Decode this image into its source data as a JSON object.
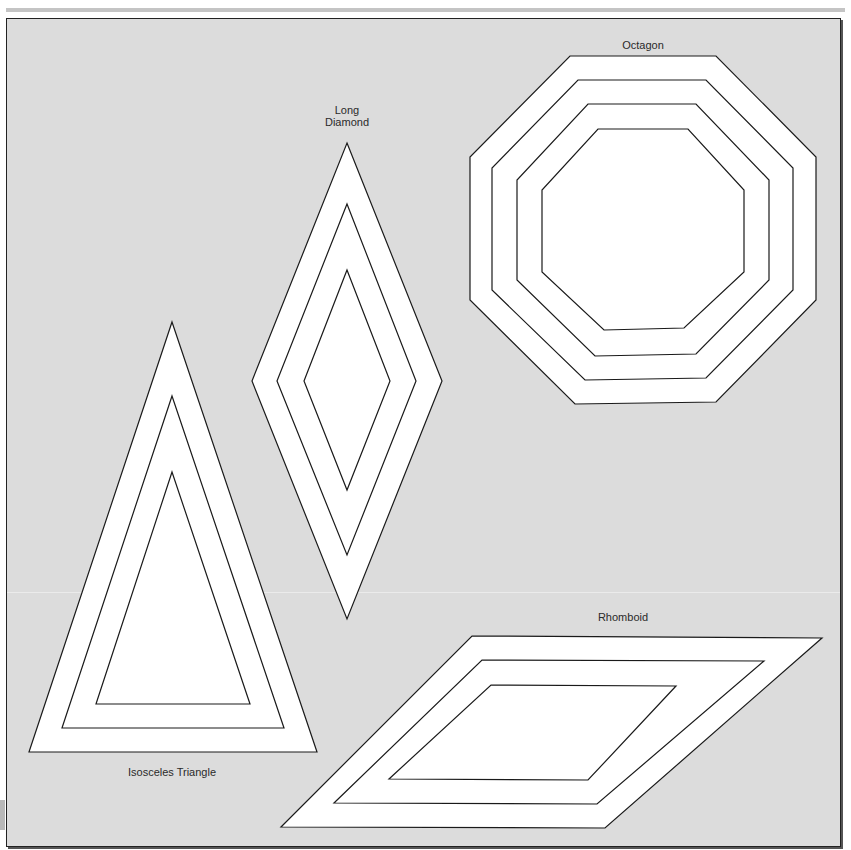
{
  "colors": {
    "background": "#dcdcdc",
    "shape_fill": "#ffffff",
    "stroke": "#1a1a1a",
    "frame_border": "#222222",
    "top_bar": "#c4c4c4"
  },
  "shapes": [
    {
      "id": "octagon",
      "label": "Octagon",
      "label_pos": [
        643,
        45
      ],
      "rings": [
        [
          [
            570,
            56
          ],
          [
            716,
            56
          ],
          [
            816,
            157
          ],
          [
            816,
            300
          ],
          [
            716,
            402
          ],
          [
            575,
            404
          ],
          [
            470,
            300
          ],
          [
            470,
            157
          ]
        ],
        [
          [
            578,
            80
          ],
          [
            706,
            80
          ],
          [
            793,
            168
          ],
          [
            793,
            290
          ],
          [
            706,
            378
          ],
          [
            585,
            380
          ],
          [
            492,
            290
          ],
          [
            492,
            168
          ]
        ],
        [
          [
            588,
            104
          ],
          [
            696,
            104
          ],
          [
            769,
            180
          ],
          [
            769,
            280
          ],
          [
            696,
            354
          ],
          [
            595,
            356
          ],
          [
            517,
            280
          ],
          [
            517,
            180
          ]
        ],
        [
          [
            598,
            129
          ],
          [
            688,
            129
          ],
          [
            744,
            190
          ],
          [
            744,
            272
          ],
          [
            684,
            328
          ],
          [
            604,
            330
          ],
          [
            542,
            272
          ],
          [
            542,
            190
          ]
        ]
      ]
    },
    {
      "id": "long-diamond",
      "label": "Long\nDiamond",
      "label_pos": [
        347,
        116
      ],
      "rings": [
        [
          [
            347,
            143
          ],
          [
            442,
            381
          ],
          [
            347,
            619
          ],
          [
            252,
            381
          ]
        ],
        [
          [
            347,
            204
          ],
          [
            416,
            381
          ],
          [
            347,
            555
          ],
          [
            277,
            381
          ]
        ],
        [
          [
            347,
            270
          ],
          [
            390,
            381
          ],
          [
            347,
            490
          ],
          [
            304,
            381
          ]
        ]
      ]
    },
    {
      "id": "isosceles-triangle",
      "label": "Isosceles Triangle",
      "label_pos": [
        172,
        772
      ],
      "rings": [
        [
          [
            172,
            322
          ],
          [
            317,
            752
          ],
          [
            29,
            752
          ]
        ],
        [
          [
            172,
            396
          ],
          [
            284,
            728
          ],
          [
            62,
            728
          ]
        ],
        [
          [
            172,
            472
          ],
          [
            250,
            704
          ],
          [
            96,
            704
          ]
        ]
      ]
    },
    {
      "id": "rhomboid",
      "label": "Rhomboid",
      "label_pos": [
        623,
        617
      ],
      "rings": [
        [
          [
            472,
            636
          ],
          [
            822,
            638
          ],
          [
            605,
            828
          ],
          [
            281,
            827
          ]
        ],
        [
          [
            482,
            660
          ],
          [
            764,
            661
          ],
          [
            597,
            804
          ],
          [
            334,
            803
          ]
        ],
        [
          [
            491,
            685
          ],
          [
            676,
            686
          ],
          [
            588,
            780
          ],
          [
            389,
            779
          ]
        ]
      ]
    }
  ]
}
